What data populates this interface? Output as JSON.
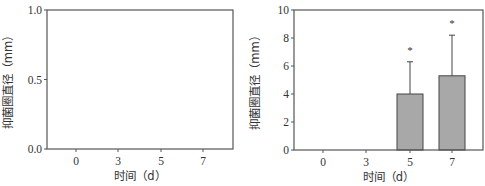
{
  "chart_data": [
    {
      "type": "bar",
      "title": "",
      "xlabel": "时间（d）",
      "ylabel": "抑菌圈直径（mm）",
      "categories": [
        "0",
        "3",
        "5",
        "7"
      ],
      "values": [
        null,
        null,
        null,
        null
      ],
      "ylim": [
        0.0,
        1.0
      ],
      "yticks": [
        "0.0",
        "0.5",
        "1.0"
      ],
      "grid": false,
      "legend": null,
      "note": "empty panel – no bars drawn"
    },
    {
      "type": "bar",
      "title": "",
      "xlabel": "时间（d）",
      "ylabel": "抑菌圈直径（mm）",
      "categories": [
        "0",
        "3",
        "5",
        "7"
      ],
      "values": [
        0,
        0,
        4.0,
        5.3
      ],
      "error_upper": [
        0,
        0,
        6.3,
        8.2
      ],
      "annotations": [
        "",
        "",
        "*",
        "*"
      ],
      "ylim": [
        0,
        10
      ],
      "yticks": [
        "0",
        "2",
        "4",
        "6",
        "8",
        "10"
      ],
      "grid": false,
      "legend": null,
      "bar_color": "#a8a8a8"
    }
  ]
}
